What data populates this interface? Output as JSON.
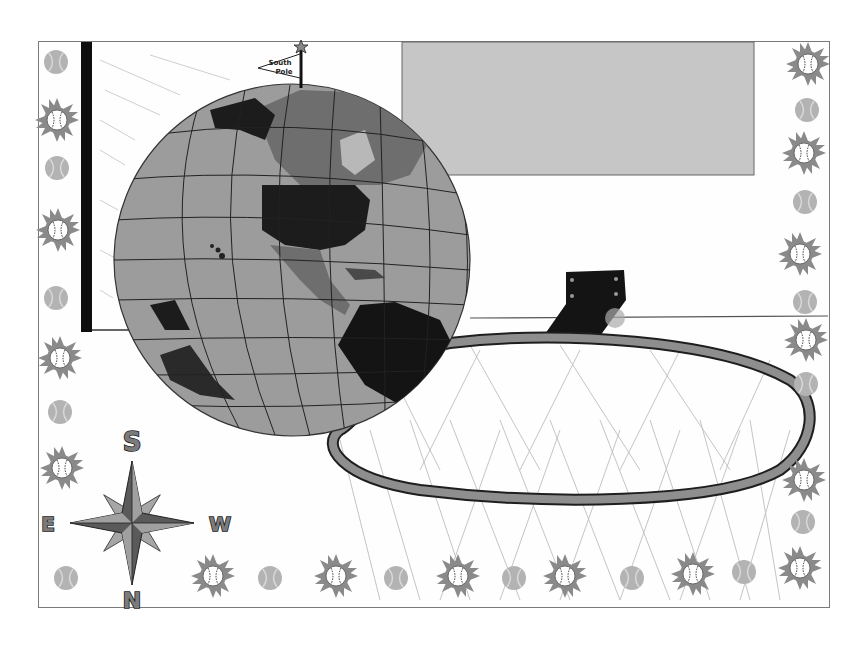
{
  "artwork": {
    "description": "Hand-drawn grayscale artwork: globe as basketball falling into a hoop, bordered by sun-baseballs and tennis balls",
    "flag": {
      "line1": "South",
      "line2": "Pole"
    },
    "compass": {
      "top": "S",
      "bottom": "N",
      "left": "E",
      "right": "W"
    },
    "colors": {
      "background": "#ffffff",
      "frame": "#7a7a7a",
      "backboard": "#c4c4c4",
      "globe_ocean": "#9a9a9a",
      "globe_land_dark": "#1c1c1c",
      "globe_land_mid": "#6e6e6e",
      "rim": "#8e8e8e",
      "border_sun": "#8a8a8a",
      "tennis_ball": "#b0b0b0",
      "bracket": "#141414",
      "pole": "#0e0e0e"
    }
  }
}
